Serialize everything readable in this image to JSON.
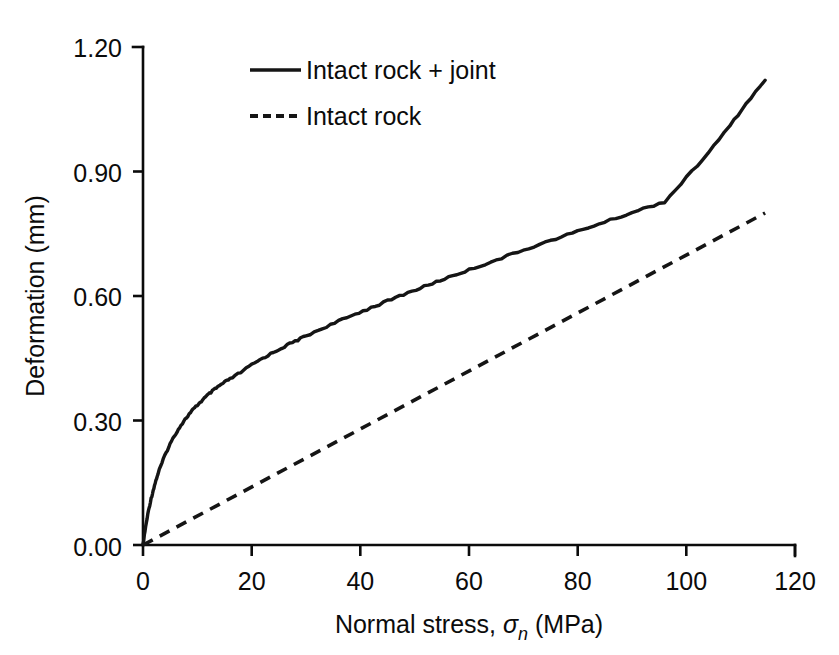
{
  "chart_data": {
    "type": "line",
    "title": "",
    "xlabel_parts": {
      "prefix": "Normal stress, ",
      "symbol": "σ",
      "subscript": "n",
      "suffix": " (MPa)"
    },
    "xlabel": "Normal stress, σn (MPa)",
    "ylabel": "Deformation (mm)",
    "xlim": [
      0,
      120
    ],
    "ylim": [
      0.0,
      1.2
    ],
    "xticks": [
      0,
      20,
      40,
      60,
      80,
      100,
      120
    ],
    "xtick_labels": [
      "0",
      "20",
      "40",
      "60",
      "80",
      "100",
      "120"
    ],
    "yticks": [
      0.0,
      0.3,
      0.6,
      0.9,
      1.2
    ],
    "ytick_labels": [
      "0.00",
      "0.30",
      "0.60",
      "0.90",
      "1.20"
    ],
    "grid": false,
    "legend_position": "top-center",
    "series": [
      {
        "name": "Intact rock + joint",
        "style": "solid",
        "color": "#151515",
        "x": [
          0,
          0.5,
          1,
          1.5,
          2,
          2.5,
          3,
          4,
          5,
          6,
          7,
          8,
          9,
          10,
          11,
          12,
          13,
          14,
          15,
          16,
          18,
          20,
          22,
          24,
          26,
          28,
          30,
          33,
          36,
          39,
          42,
          45,
          48,
          51,
          54,
          57,
          60,
          64,
          68,
          72,
          76,
          80,
          84,
          88,
          92,
          96,
          100,
          104,
          108,
          111,
          114.5
        ],
        "y": [
          0.0,
          0.045,
          0.082,
          0.112,
          0.138,
          0.161,
          0.181,
          0.215,
          0.244,
          0.268,
          0.289,
          0.307,
          0.323,
          0.337,
          0.35,
          0.362,
          0.373,
          0.383,
          0.392,
          0.4,
          0.416,
          0.434,
          0.45,
          0.464,
          0.478,
          0.491,
          0.504,
          0.522,
          0.539,
          0.556,
          0.572,
          0.588,
          0.604,
          0.619,
          0.634,
          0.649,
          0.663,
          0.682,
          0.701,
          0.72,
          0.738,
          0.756,
          0.774,
          0.792,
          0.81,
          0.827,
          0.885,
          0.944,
          1.01,
          1.063,
          1.12
        ]
      },
      {
        "name": "Intact rock",
        "style": "dashed",
        "color": "#151515",
        "x": [
          0,
          114.5
        ],
        "y": [
          0.0,
          0.8
        ]
      }
    ],
    "legend_entries": [
      {
        "label": "Intact rock + joint",
        "style": "solid"
      },
      {
        "label": "Intact rock",
        "style": "dashed"
      }
    ]
  },
  "colors": {
    "background": "#ffffff",
    "ink": "#0b0b0b",
    "series": "#151515"
  }
}
